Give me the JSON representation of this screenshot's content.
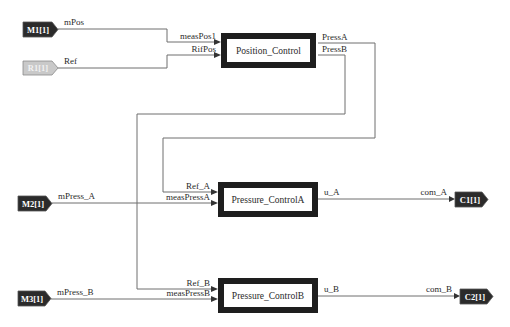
{
  "colors": {
    "wire": "#6e6e6e",
    "block_border": "#1e1e1e",
    "block_fill": "#ffffff",
    "tag_dark": "#2b2b2b",
    "tag_light": "#c9c9c9",
    "background": "#ffffff"
  },
  "input_tags": {
    "m1": "M1[1]",
    "r1": "R1[1]",
    "m2": "M2[1]",
    "m3": "M3[1]"
  },
  "output_tags": {
    "c1": "C1[1]",
    "c2": "C2[1]"
  },
  "blocks": {
    "position_control": {
      "name": "Position_Control",
      "inputs": [
        "measPos1",
        "RifPos"
      ],
      "outputs": [
        "PressA",
        "PressB"
      ]
    },
    "pressure_control_a": {
      "name": "Pressure_ControlA",
      "inputs": [
        "Ref_A",
        "measPressA"
      ],
      "outputs": [
        "u_A"
      ]
    },
    "pressure_control_b": {
      "name": "Pressure_ControlB",
      "inputs": [
        "Ref_B",
        "measPressB"
      ],
      "outputs": [
        "u_B"
      ]
    }
  },
  "signals": {
    "mPos": "mPos",
    "Ref": "Ref",
    "mPress_A": "mPress_A",
    "mPress_B": "mPress_B",
    "com_A": "com_A",
    "com_B": "com_B"
  }
}
